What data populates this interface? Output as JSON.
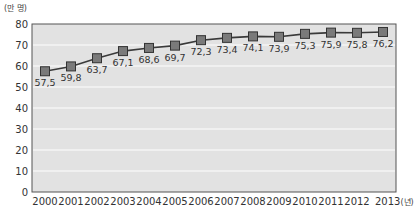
{
  "chart_data": {
    "type": "line",
    "title": "",
    "ylabel": "(만 명)",
    "xlabel": "(년)",
    "ylim": [
      0,
      80
    ],
    "yticks": [
      0,
      10,
      20,
      30,
      40,
      50,
      60,
      70,
      80
    ],
    "grid": true,
    "legend": "none",
    "categories": [
      "2000",
      "2001",
      "2002",
      "2003",
      "2004",
      "2005",
      "2006",
      "2007",
      "2008",
      "2009",
      "2010",
      "2011",
      "2012",
      "2013"
    ],
    "x_last_label": "2013(년)",
    "series": [
      {
        "name": "",
        "values": [
          57.5,
          59.8,
          63.7,
          67.1,
          68.6,
          69.7,
          72.3,
          73.4,
          74.1,
          73.9,
          75.3,
          75.9,
          75.8,
          76.2
        ],
        "labels": [
          "57,5",
          "59,8",
          "63,7",
          "67,1",
          "68,6",
          "69,7",
          "72,3",
          "73,4",
          "74,1",
          "73,9",
          "75,3",
          "75,9",
          "75,8",
          "76,2"
        ]
      }
    ]
  },
  "colors": {
    "plot_bg": "#e2e2e2",
    "grid": "#f4f4f4",
    "line": "#3a3a3a",
    "marker_fill": "#7a7a7a",
    "marker_stroke": "#333333",
    "axis": "#555555"
  }
}
